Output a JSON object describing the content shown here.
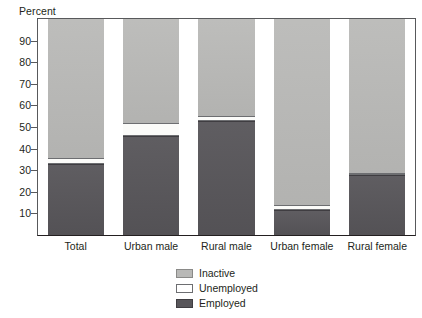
{
  "chart_data": {
    "type": "bar",
    "subtype": "stacked-bar-100",
    "title": "",
    "xlabel": "",
    "ylabel": "Percent",
    "ylim": [
      0,
      100
    ],
    "yticks": [
      10,
      20,
      30,
      40,
      50,
      60,
      70,
      80,
      90
    ],
    "grid": false,
    "legend_position": "bottom-center",
    "categories": [
      "Total",
      "Urban male",
      "Rural male",
      "Urban female",
      "Rural female"
    ],
    "series": [
      {
        "name": "Employed",
        "color": "#58565a",
        "values": [
          33.0,
          46.0,
          53.0,
          11.5,
          28.0
        ]
      },
      {
        "name": "Unemployed",
        "color": "#ffffff",
        "values": [
          2.5,
          6.0,
          2.0,
          2.5,
          0.5
        ]
      },
      {
        "name": "Inactive",
        "color": "#b9b9b7",
        "values": [
          64.5,
          48.0,
          45.0,
          86.0,
          71.5
        ]
      }
    ],
    "stack_order_bottom_to_top": [
      "Employed",
      "Unemployed",
      "Inactive"
    ]
  },
  "axis": {
    "y_title": "Percent",
    "y_tick_labels": [
      "90",
      "80",
      "70",
      "60",
      "50",
      "40",
      "30",
      "20",
      "10"
    ]
  },
  "legend": {
    "items": [
      {
        "label": "Inactive",
        "swatch": "inactive"
      },
      {
        "label": "Unemployed",
        "swatch": "unemployed"
      },
      {
        "label": "Employed",
        "swatch": "employed"
      }
    ]
  }
}
